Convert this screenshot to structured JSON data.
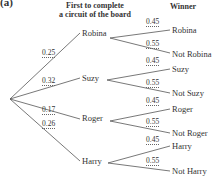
{
  "part_label": "(a)",
  "headers": {
    "first_line1": "First to complete",
    "first_line2": "a circuit of the board",
    "winner": "Winner"
  },
  "first_level": [
    {
      "name": "Robina",
      "prob": "0.25"
    },
    {
      "name": "Suzy",
      "prob": "0.32"
    },
    {
      "name": "Roger",
      "prob": "0.17"
    },
    {
      "name": "Harry",
      "prob": "0.26"
    }
  ],
  "second_level": [
    {
      "win": "Robina",
      "win_prob": "0.45",
      "lose": "Not Robina",
      "lose_prob": "0.55"
    },
    {
      "win": "Suzy",
      "win_prob": "0.45",
      "lose": "Not Suzy",
      "lose_prob": "0.55"
    },
    {
      "win": "Roger",
      "win_prob": "0.45",
      "lose": "Not Roger",
      "lose_prob": "0.55"
    },
    {
      "win": "Harry",
      "win_prob": "0.45",
      "lose": "Not Harry",
      "lose_prob": "0.55"
    }
  ]
}
